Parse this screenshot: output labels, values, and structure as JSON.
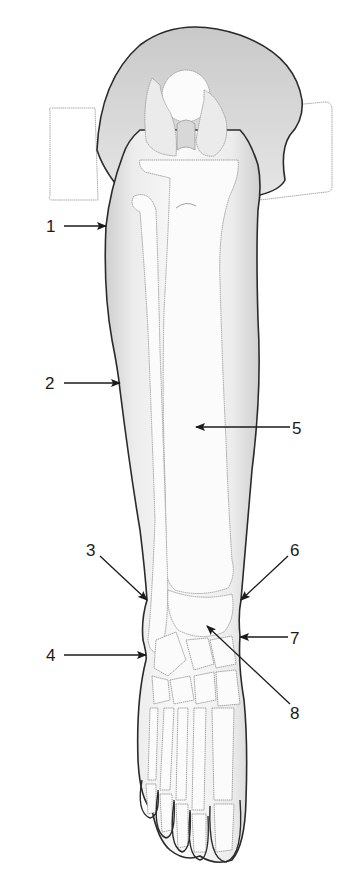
{
  "figure": {
    "colors": {
      "background": "#ffffff",
      "outline": "#2a2a2a",
      "skin_shade": "#d9d9d9",
      "bone_fill": "#fbfbfb",
      "bone_stroke": "#9a9a9a",
      "text": "#1a1a1a"
    }
  },
  "labels": [
    {
      "id": "1",
      "text": "1",
      "x": 52,
      "y": 232,
      "points_to": "lateral upper leg (calf outline)"
    },
    {
      "id": "2",
      "text": "2",
      "x": 50,
      "y": 389,
      "points_to": "lateral mid leg outline"
    },
    {
      "id": "3",
      "text": "3",
      "x": 92,
      "y": 556,
      "points_to": "lateral ankle"
    },
    {
      "id": "4",
      "text": "4",
      "x": 50,
      "y": 661,
      "points_to": "lateral foot"
    },
    {
      "id": "5",
      "text": "5",
      "x": 294,
      "y": 434,
      "points_to": "tibia shaft"
    },
    {
      "id": "6",
      "text": "6",
      "x": 293,
      "y": 556,
      "points_to": "medial ankle"
    },
    {
      "id": "7",
      "text": "7",
      "x": 293,
      "y": 644,
      "points_to": "medial foot"
    },
    {
      "id": "8",
      "text": "8",
      "x": 293,
      "y": 719,
      "points_to": "talus"
    }
  ]
}
